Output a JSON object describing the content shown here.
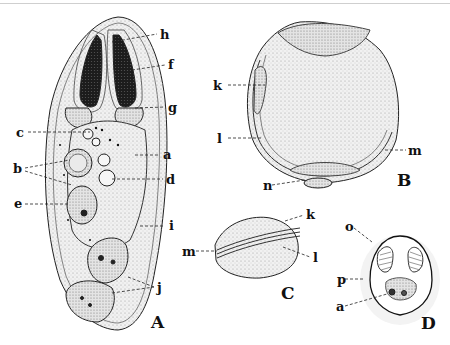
{
  "figure": {
    "panels": [
      {
        "id": "A",
        "label": "A",
        "labels": [
          "h",
          "f",
          "g",
          "c",
          "a",
          "b",
          "d",
          "e",
          "i",
          "j"
        ]
      },
      {
        "id": "B",
        "label": "B",
        "labels": [
          "k",
          "l",
          "m",
          "n"
        ]
      },
      {
        "id": "C",
        "label": "C",
        "labels": [
          "k",
          "m",
          "l"
        ]
      },
      {
        "id": "D",
        "label": "D",
        "labels": [
          "o",
          "p",
          "a"
        ]
      }
    ],
    "colors": {
      "ink": "#111111",
      "stipple": "#8a8a8a",
      "dark": "#1a1a1a",
      "fill": "#ececec"
    }
  },
  "labels": {
    "A": {
      "h": "h",
      "f": "f",
      "g": "g",
      "c": "c",
      "a": "a",
      "b": "b",
      "d": "d",
      "e": "e",
      "i": "i",
      "j": "j"
    },
    "B": {
      "k": "k",
      "l": "l",
      "m": "m",
      "n": "n"
    },
    "C": {
      "k": "k",
      "m": "m",
      "l": "l"
    },
    "D": {
      "o": "o",
      "p": "p",
      "a": "a"
    }
  },
  "panel_letters": {
    "A": "A",
    "B": "B",
    "C": "C",
    "D": "D"
  }
}
